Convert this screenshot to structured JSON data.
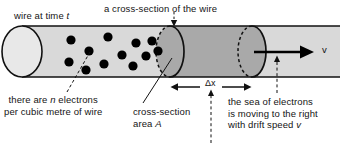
{
  "figure": {
    "colors": {
      "wire_light": "#d9d9d9",
      "wire_dark": "#a9a9a9",
      "cap_light": "#e8e8e8",
      "outline": "#111111",
      "electron": "#000000",
      "background": "#ffffff",
      "text": "#141414"
    }
  },
  "labels": {
    "wire_at_time": {
      "pre": "wire at time ",
      "sym": "t",
      "post": ""
    },
    "cross_section_top": "a cross-section of the wire",
    "n_electrons": {
      "line1_pre": "there are ",
      "line1_sym": "n",
      "line1_post": " electrons",
      "line2": "per cubic metre of wire"
    },
    "cross_section_area": {
      "line1": "cross-section",
      "line2_pre": "area ",
      "line2_sym": "A",
      "line2_post": ""
    },
    "sea_of_electrons": {
      "line1": "the sea of electrons",
      "line2": "is moving to the right",
      "line3_pre": "with drift speed ",
      "line3_sym": "v",
      "line3_post": ""
    },
    "delta_x": "Δx",
    "velocity_arrow": "v"
  },
  "geometry": {
    "wire_top_y": 26,
    "wire_bottom_y": 77,
    "wire_left_x": 22,
    "wire_right_x": 340,
    "cap_center_x": 22,
    "cap_rx": 20,
    "cap_ry": 25.5,
    "cross_section_x": 170,
    "drift_end_x": 252,
    "delta_x_left": 172,
    "delta_x_right": 252
  },
  "electrons": [
    {
      "cx": 71,
      "cy": 40
    },
    {
      "cx": 108,
      "cy": 37
    },
    {
      "cx": 136,
      "cy": 43
    },
    {
      "cx": 152,
      "cy": 41
    },
    {
      "cx": 89,
      "cy": 51
    },
    {
      "cx": 122,
      "cy": 55
    },
    {
      "cx": 146,
      "cy": 56
    },
    {
      "cx": 69,
      "cy": 62
    },
    {
      "cx": 104,
      "cy": 64
    },
    {
      "cx": 133,
      "cy": 66
    },
    {
      "cx": 158,
      "cy": 51
    },
    {
      "cx": 86,
      "cy": 70
    }
  ]
}
